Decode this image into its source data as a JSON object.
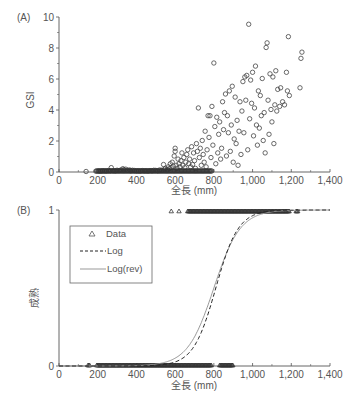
{
  "chart_data": [
    {
      "panel": "(A)",
      "type": "scatter",
      "title": "",
      "xlabel": "全長 (mm)",
      "ylabel": "GSI",
      "xlim": [
        0,
        1400
      ],
      "ylim": [
        0,
        10
      ],
      "xticks": [
        0,
        200,
        400,
        600,
        800,
        1000,
        1200,
        1400
      ],
      "xtick_labels": [
        "0",
        "200",
        "400",
        "600",
        "800",
        "1,000",
        "1,200",
        "1,400"
      ],
      "yticks": [
        0,
        2,
        4,
        6,
        8,
        10
      ],
      "ytick_labels": [
        "0",
        "2",
        "4",
        "6",
        "8",
        "10"
      ],
      "marker": "open-circle",
      "grid": false,
      "legend": null,
      "points": [
        [
          140,
          0
        ],
        [
          190,
          0.02
        ],
        [
          205,
          0.03
        ],
        [
          215,
          0.02
        ],
        [
          225,
          0.05
        ],
        [
          235,
          0.04
        ],
        [
          245,
          0.03
        ],
        [
          255,
          0.06
        ],
        [
          265,
          0.05
        ],
        [
          270,
          0.25
        ],
        [
          280,
          0.05
        ],
        [
          290,
          0.04
        ],
        [
          300,
          0.08
        ],
        [
          310,
          0.06
        ],
        [
          320,
          0.1
        ],
        [
          330,
          0.18
        ],
        [
          335,
          0.12
        ],
        [
          345,
          0.15
        ],
        [
          355,
          0.08
        ],
        [
          365,
          0.1
        ],
        [
          370,
          0.05
        ],
        [
          380,
          0.08
        ],
        [
          390,
          0.06
        ],
        [
          400,
          0.04
        ],
        [
          410,
          0.05
        ],
        [
          420,
          0.03
        ],
        [
          430,
          0.06
        ],
        [
          440,
          0.04
        ],
        [
          450,
          0.05
        ],
        [
          460,
          0.03
        ],
        [
          470,
          0.06
        ],
        [
          480,
          0.05
        ],
        [
          490,
          0.08
        ],
        [
          500,
          0.07
        ],
        [
          510,
          0.05
        ],
        [
          520,
          0.1
        ],
        [
          530,
          0.08
        ],
        [
          540,
          0.45
        ],
        [
          545,
          0.15
        ],
        [
          550,
          0.2
        ],
        [
          560,
          0.12
        ],
        [
          565,
          0.3
        ],
        [
          570,
          0.18
        ],
        [
          575,
          0.5
        ],
        [
          580,
          0.25
        ],
        [
          585,
          0.6
        ],
        [
          590,
          0.35
        ],
        [
          595,
          1.0
        ],
        [
          600,
          1.3
        ],
        [
          600,
          1.5
        ],
        [
          605,
          0.4
        ],
        [
          610,
          0.2
        ],
        [
          615,
          0.8
        ],
        [
          620,
          0.5
        ],
        [
          625,
          0.3
        ],
        [
          630,
          0.7
        ],
        [
          635,
          1.2
        ],
        [
          640,
          0.4
        ],
        [
          645,
          0.9
        ],
        [
          650,
          0.25
        ],
        [
          655,
          0.6
        ],
        [
          660,
          1.1
        ],
        [
          665,
          1.4
        ],
        [
          670,
          0.5
        ],
        [
          675,
          0.8
        ],
        [
          680,
          0.3
        ],
        [
          685,
          1.6
        ],
        [
          690,
          0.45
        ],
        [
          695,
          1.2
        ],
        [
          700,
          0.7
        ],
        [
          705,
          0.2
        ],
        [
          710,
          1.8
        ],
        [
          715,
          1.3
        ],
        [
          720,
          4.1
        ],
        [
          725,
          0.9
        ],
        [
          730,
          1.5
        ],
        [
          735,
          0.4
        ],
        [
          740,
          2.0
        ],
        [
          745,
          1.1
        ],
        [
          750,
          0.6
        ],
        [
          755,
          2.6
        ],
        [
          760,
          0.3
        ],
        [
          765,
          1.4
        ],
        [
          770,
          3.6
        ],
        [
          775,
          2.2
        ],
        [
          780,
          3.6
        ],
        [
          785,
          0.9
        ],
        [
          790,
          4.2
        ],
        [
          795,
          1.7
        ],
        [
          800,
          7.0
        ],
        [
          805,
          2.9
        ],
        [
          810,
          0.5
        ],
        [
          815,
          3.5
        ],
        [
          820,
          1.2
        ],
        [
          825,
          2.4
        ],
        [
          830,
          3.2
        ],
        [
          835,
          0.8
        ],
        [
          840,
          1.5
        ],
        [
          845,
          4.5
        ],
        [
          850,
          2.7
        ],
        [
          855,
          3.8
        ],
        [
          860,
          5.0
        ],
        [
          865,
          1.0
        ],
        [
          870,
          3.6
        ],
        [
          875,
          2.5
        ],
        [
          880,
          5.2
        ],
        [
          885,
          1.3
        ],
        [
          890,
          3.0
        ],
        [
          895,
          5.5
        ],
        [
          900,
          0.6
        ],
        [
          905,
          2.1
        ],
        [
          910,
          4.8
        ],
        [
          915,
          1.8
        ],
        [
          920,
          3.3
        ],
        [
          925,
          0.4
        ],
        [
          930,
          2.6
        ],
        [
          935,
          4.5
        ],
        [
          940,
          1.1
        ],
        [
          945,
          3.9
        ],
        [
          950,
          5.8
        ],
        [
          955,
          2.5
        ],
        [
          960,
          6.1
        ],
        [
          965,
          4.6
        ],
        [
          970,
          6.2
        ],
        [
          975,
          1.4
        ],
        [
          980,
          9.5
        ],
        [
          985,
          3.4
        ],
        [
          990,
          5.9
        ],
        [
          995,
          4.4
        ],
        [
          1000,
          6.4
        ],
        [
          1005,
          2.3
        ],
        [
          1010,
          4.1
        ],
        [
          1015,
          6.8
        ],
        [
          1020,
          3.0
        ],
        [
          1025,
          1.7
        ],
        [
          1030,
          5.2
        ],
        [
          1035,
          2.8
        ],
        [
          1040,
          4.9
        ],
        [
          1045,
          3.6
        ],
        [
          1050,
          6.0
        ],
        [
          1055,
          2.0
        ],
        [
          1060,
          3.8
        ],
        [
          1065,
          1.2
        ],
        [
          1070,
          8.0
        ],
        [
          1075,
          8.3
        ],
        [
          1080,
          4.6
        ],
        [
          1085,
          2.4
        ],
        [
          1090,
          6.3
        ],
        [
          1095,
          4.0
        ],
        [
          1100,
          3.2
        ],
        [
          1105,
          6.1
        ],
        [
          1110,
          1.8
        ],
        [
          1115,
          4.3
        ],
        [
          1120,
          6.5
        ],
        [
          1125,
          3.9
        ],
        [
          1130,
          5.3
        ],
        [
          1140,
          4.2
        ],
        [
          1145,
          5.4
        ],
        [
          1155,
          4.5
        ],
        [
          1165,
          4.3
        ],
        [
          1175,
          6.4
        ],
        [
          1180,
          5.2
        ],
        [
          1185,
          8.7
        ],
        [
          1190,
          4.9
        ],
        [
          1245,
          5.4
        ],
        [
          1250,
          7.3
        ],
        [
          1255,
          7.7
        ]
      ]
    },
    {
      "panel": "(B)",
      "type": "scatter+line",
      "title": "",
      "xlabel": "全長 (mm)",
      "ylabel": "成熟",
      "xlim": [
        0,
        1400
      ],
      "ylim": [
        0,
        1
      ],
      "xticks": [
        0,
        200,
        400,
        600,
        800,
        1000,
        1200,
        1400
      ],
      "xtick_labels": [
        "0",
        "200",
        "400",
        "600",
        "800",
        "1,000",
        "1,200",
        "1,400"
      ],
      "yticks": [
        0,
        1
      ],
      "ytick_labels": [
        "0",
        "1"
      ],
      "grid": false,
      "legend": {
        "position": "upper-left",
        "entries": [
          {
            "label": "Data",
            "style": "open-triangle"
          },
          {
            "label": "Log",
            "style": "dashed-line"
          },
          {
            "label": "Log(rev)",
            "style": "solid-gray-line"
          }
        ]
      },
      "series": [
        {
          "name": "Data",
          "kind": "points",
          "immature_x_ranges": [
            [
              150,
              160
            ],
            [
              195,
              790
            ],
            [
              830,
              900
            ]
          ],
          "mature_x_ranges": [
            [
              580,
              580
            ],
            [
              620,
              620
            ],
            [
              665,
              1190
            ],
            [
              1225,
              1235
            ]
          ]
        },
        {
          "name": "Log",
          "kind": "logistic",
          "midpoint_mm": 810,
          "scale_mm": 58,
          "style": "dashed"
        },
        {
          "name": "Log(rev)",
          "kind": "logistic",
          "midpoint_mm": 800,
          "scale_mm": 68,
          "style": "solid"
        }
      ]
    }
  ],
  "labels": {
    "panel_a": "(A)",
    "panel_b": "(B)",
    "y_a": "GSI",
    "y_b": "成熟",
    "x_label": "全長 (mm)",
    "legend_data": "Data",
    "legend_log": "Log",
    "legend_logrev": "Log(rev)"
  },
  "colors": {
    "axis": "#555555",
    "marker": "#444444",
    "curve_log": "#222222",
    "curve_logrev": "#999999"
  }
}
